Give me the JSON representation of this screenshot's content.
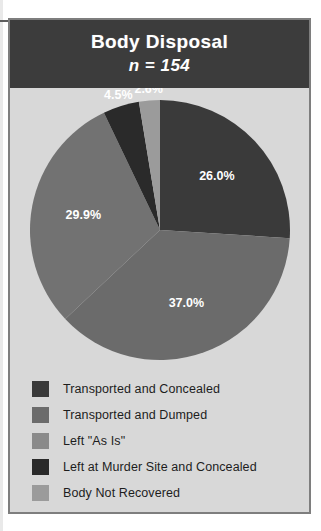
{
  "figure": {
    "title": "Body Disposal",
    "subtitle": "n = 154",
    "panel_bg": "#d8d8d8",
    "title_band_bg": "#3c3c3c",
    "title_color": "#ffffff",
    "frame_border": "#7e7e7e"
  },
  "chart_data": {
    "type": "pie",
    "title": "Body Disposal",
    "subtitle": "n = 154",
    "total_n": 154,
    "value_unit": "percent",
    "legend_position": "bottom",
    "grid": false,
    "start_angle_deg": 0,
    "direction": "clockwise",
    "categories": [
      "Transported and Concealed",
      "Transported and Dumped",
      "Left \"As Is\"",
      "Left at Murder Site and Concealed",
      "Body Not Recovered"
    ],
    "values": [
      26.0,
      37.0,
      29.9,
      4.5,
      2.6
    ],
    "labels": [
      "26.0%",
      "37.0%",
      "29.9%",
      "4.5%",
      "2.6%"
    ],
    "colors": [
      "#3a3a3a",
      "#6b6b6b",
      "#727272",
      "#2a2a2a",
      "#9b9b9b"
    ],
    "slices": [
      {
        "label": "Transported and Concealed",
        "value": 26.0,
        "display": "26.0%",
        "color": "#3a3a3a"
      },
      {
        "label": "Transported and Dumped",
        "value": 37.0,
        "display": "37.0%",
        "color": "#6b6b6b"
      },
      {
        "label": "Left \"As Is\"",
        "value": 29.9,
        "display": "29.9%",
        "color": "#727272"
      },
      {
        "label": "Left at Murder Site and Concealed",
        "value": 4.5,
        "display": "4.5%",
        "color": "#2a2a2a"
      },
      {
        "label": "Body Not Recovered",
        "value": 2.6,
        "display": "2.6%",
        "color": "#9b9b9b"
      }
    ]
  },
  "legend": {
    "items": [
      {
        "label": "Transported and Concealed",
        "color": "#3a3a3a"
      },
      {
        "label": "Transported and Dumped",
        "color": "#6b6b6b"
      },
      {
        "label": "Left \"As Is\"",
        "color": "#8a8a8a"
      },
      {
        "label": "Left at Murder Site and Concealed",
        "color": "#2a2a2a"
      },
      {
        "label": "Body Not Recovered",
        "color": "#9b9b9b"
      }
    ]
  }
}
